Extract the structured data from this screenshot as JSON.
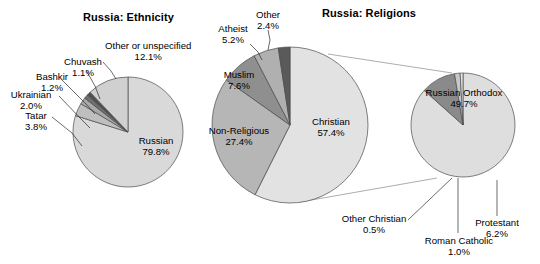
{
  "figure": {
    "width": 540,
    "height": 264,
    "background": "#ffffff"
  },
  "titles": {
    "left": "Russia: Ethnicity",
    "right": "Russia: Religions"
  },
  "labels": {
    "ethnicity": {
      "other": "Other or unspecified",
      "other_pct": "12.1%",
      "chuvash": "Chuvash",
      "chuvash_pct": "1.1%",
      "bashkir": "Bashkir",
      "bashkir_pct": "1.2%",
      "ukrainian": "Ukrainian",
      "ukrainian_pct": "2.0%",
      "tatar": "Tatar",
      "tatar_pct": "3.8%",
      "russian": "Russian",
      "russian_pct": "79.8%"
    },
    "religions": {
      "other": "Other",
      "other_pct": "2.4%",
      "atheist": "Atheist",
      "atheist_pct": "5.2%",
      "muslim": "Muslim",
      "muslim_pct": "7.6%",
      "nonreligious": "Non-Religious",
      "nonreligious_pct": "27.4%",
      "christian": "Christian",
      "christian_pct": "57.4%"
    },
    "christian_breakdown": {
      "orthodox": "Russian Orthodox",
      "orthodox_pct": "49.7%",
      "protestant": "Protestant",
      "protestant_pct": "6.2%",
      "roman_catholic": "Roman Catholic",
      "roman_catholic_pct": "1.0%",
      "other_christian": "Other Christian",
      "other_christian_pct": "0.5%"
    }
  },
  "chart_data": [
    {
      "type": "pie",
      "title": "Russia: Ethnicity",
      "categories": [
        "Russian",
        "Tatar",
        "Ukrainian",
        "Bashkir",
        "Chuvash",
        "Other or unspecified"
      ],
      "values": [
        79.8,
        3.8,
        2.0,
        1.2,
        1.1,
        12.1
      ],
      "units": "percent",
      "colors": [
        "#d9d9d9",
        "#bfbfbf",
        "#a8a8a8",
        "#707070",
        "#4f4f4f",
        "#d0d0d0"
      ],
      "center": [
        128,
        132
      ],
      "radius": 55,
      "start_angle_deg": -90,
      "direction": "clockwise",
      "legend": "none",
      "labels_outside": [
        "Chuvash",
        "Bashkir",
        "Ukrainian",
        "Tatar",
        "Other or unspecified"
      ],
      "labels_inside": [
        "Russian"
      ]
    },
    {
      "type": "pie",
      "title": "Russia: Religions",
      "categories": [
        "Christian",
        "Non-Religious",
        "Muslim",
        "Atheist",
        "Other"
      ],
      "values": [
        57.4,
        27.4,
        7.6,
        5.2,
        2.4
      ],
      "units": "percent",
      "colors": [
        "#e2e2e2",
        "#b6b6b6",
        "#8f8f8f",
        "#b0b0b0",
        "#5a5a5a"
      ],
      "center": [
        290,
        125
      ],
      "radius": 78,
      "start_angle_deg": -90,
      "direction": "clockwise",
      "legend": "none",
      "labels_inside": [
        "Christian",
        "Non-Religious",
        "Muslim"
      ],
      "labels_outside": [
        "Atheist",
        "Other"
      ]
    },
    {
      "type": "pie",
      "title": "Christian breakdown",
      "subtitle": "exploded from Christian 57.4%",
      "categories": [
        "Russian Orthodox",
        "Protestant",
        "Roman Catholic",
        "Other Christian"
      ],
      "values": [
        49.7,
        6.2,
        1.0,
        0.5
      ],
      "units": "percent of total population",
      "colors": [
        "#dedede",
        "#8a8a8a",
        "#c8c8c8",
        "#e6e6e6"
      ],
      "center": [
        463,
        125
      ],
      "radius": 52,
      "start_angle_deg": -90,
      "direction": "clockwise",
      "legend": "none",
      "labels_inside": [
        "Russian Orthodox"
      ],
      "labels_outside": [
        "Protestant",
        "Roman Catholic",
        "Other Christian"
      ]
    }
  ]
}
